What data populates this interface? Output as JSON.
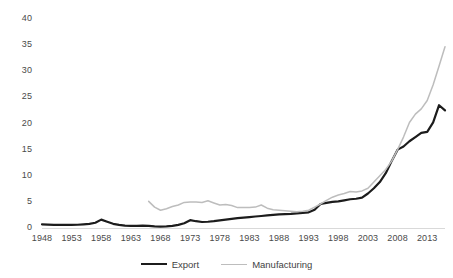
{
  "chart_data": {
    "type": "line",
    "title": "",
    "subtitle": "",
    "xlabel": "",
    "ylabel": "",
    "xlim": [
      1948,
      2016
    ],
    "ylim": [
      0,
      40
    ],
    "ytick_step": 5,
    "xtick_step": 5,
    "grid": false,
    "legend_position": "bottom",
    "ytick_labels": [
      "0",
      "5",
      "10",
      "15",
      "20",
      "25",
      "30",
      "35",
      "40"
    ],
    "ytick_values": [
      0,
      5,
      10,
      15,
      20,
      25,
      30,
      35,
      40
    ],
    "xtick_labels": [
      "1948",
      "1953",
      "1958",
      "1963",
      "1968",
      "1973",
      "1978",
      "1983",
      "1988",
      "1993",
      "1998",
      "2003",
      "2008",
      "2013"
    ],
    "xtick_values": [
      1948,
      1953,
      1958,
      1963,
      1968,
      1973,
      1978,
      1983,
      1988,
      1993,
      1998,
      2003,
      2008,
      2013
    ],
    "series": [
      {
        "name": "Export",
        "color": "#1c1c1c",
        "width": 2.2,
        "x": [
          1948,
          1949,
          1950,
          1951,
          1952,
          1953,
          1954,
          1955,
          1956,
          1957,
          1958,
          1959,
          1960,
          1961,
          1962,
          1963,
          1964,
          1965,
          1966,
          1967,
          1968,
          1969,
          1970,
          1971,
          1972,
          1973,
          1974,
          1975,
          1976,
          1977,
          1978,
          1979,
          1980,
          1981,
          1982,
          1983,
          1984,
          1985,
          1986,
          1987,
          1988,
          1989,
          1990,
          1991,
          1992,
          1993,
          1994,
          1995,
          1996,
          1997,
          1998,
          1999,
          2000,
          2001,
          2002,
          2003,
          2004,
          2005,
          2006,
          2007,
          2008,
          2009,
          2010,
          2011,
          2012,
          2013,
          2014,
          2015,
          2016
        ],
        "values": [
          0.7,
          0.65,
          0.6,
          0.6,
          0.6,
          0.6,
          0.62,
          0.7,
          0.8,
          1.0,
          1.6,
          1.2,
          0.8,
          0.6,
          0.45,
          0.4,
          0.4,
          0.45,
          0.4,
          0.3,
          0.25,
          0.3,
          0.4,
          0.6,
          0.9,
          1.5,
          1.3,
          1.15,
          1.2,
          1.3,
          1.45,
          1.6,
          1.75,
          1.9,
          2.0,
          2.1,
          2.2,
          2.3,
          2.4,
          2.5,
          2.6,
          2.65,
          2.7,
          2.8,
          2.9,
          3.0,
          3.5,
          4.6,
          4.8,
          5.0,
          5.1,
          5.3,
          5.5,
          5.6,
          5.8,
          6.6,
          7.6,
          8.8,
          10.5,
          12.8,
          15.0,
          15.6,
          16.6,
          17.4,
          18.2,
          18.4,
          20.2,
          23.5,
          22.5
        ]
      },
      {
        "name": "Manufacturing",
        "color": "#bdbdbd",
        "width": 1.5,
        "x": [
          1966,
          1967,
          1968,
          1969,
          1970,
          1971,
          1972,
          1973,
          1974,
          1975,
          1976,
          1977,
          1978,
          1979,
          1980,
          1981,
          1982,
          1983,
          1984,
          1985,
          1986,
          1987,
          1988,
          1989,
          1990,
          1991,
          1992,
          1993,
          1994,
          1995,
          1996,
          1997,
          1998,
          1999,
          2000,
          2001,
          2002,
          2003,
          2004,
          2005,
          2006,
          2007,
          2008,
          2009,
          2010,
          2011,
          2012,
          2013,
          2014,
          2015,
          2016
        ],
        "values": [
          5.1,
          4.0,
          3.4,
          3.7,
          4.1,
          4.4,
          4.9,
          5.0,
          5.0,
          4.9,
          5.2,
          4.8,
          4.4,
          4.5,
          4.3,
          3.9,
          3.9,
          3.9,
          4.0,
          4.4,
          3.8,
          3.5,
          3.4,
          3.3,
          3.2,
          3.1,
          3.2,
          3.4,
          4.0,
          4.6,
          5.3,
          5.9,
          6.3,
          6.6,
          7.0,
          6.9,
          7.1,
          7.6,
          8.8,
          10.0,
          11.2,
          12.8,
          15.0,
          17.4,
          20.2,
          21.8,
          22.8,
          24.4,
          27.4,
          31.0,
          34.7
        ]
      }
    ]
  },
  "legend": {
    "items": [
      {
        "label": "Export",
        "color": "#1c1c1c"
      },
      {
        "label": "Manufacturing",
        "color": "#bdbdbd"
      }
    ]
  }
}
